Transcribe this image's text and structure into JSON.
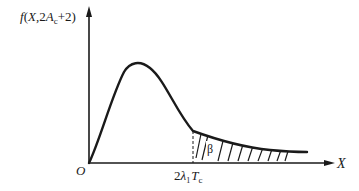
{
  "diagram": {
    "type": "probability-density-curve",
    "y_axis_label": {
      "f": "f",
      "open": "(",
      "X": "X",
      "comma": ",",
      "two": "2",
      "A": "A",
      "sub": "c",
      "rest": "+2)"
    },
    "x_axis_label": "X",
    "origin_label": "O",
    "threshold_label": {
      "coef": "2",
      "lambda": "λ",
      "lambda_sub": "1",
      "T": "T",
      "T_sub": "c"
    },
    "region_label": "β",
    "colors": {
      "stroke": "#1a1a1a",
      "background": "#ffffff"
    }
  }
}
